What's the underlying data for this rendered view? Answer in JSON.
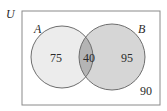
{
  "diagram": {
    "type": "venn",
    "universe_label": "U",
    "sets": [
      {
        "name": "A",
        "only_count": "75"
      },
      {
        "name": "B",
        "only_count": "95"
      }
    ],
    "intersection_count": "40",
    "outside_count": "90"
  },
  "colors": {
    "border": "#7a7a7a",
    "a_fill": "#ececec",
    "b_fill": "#d6d6d6",
    "intersection_fill": "#b4b4b4",
    "circle_stroke": "#6e6e6e"
  }
}
